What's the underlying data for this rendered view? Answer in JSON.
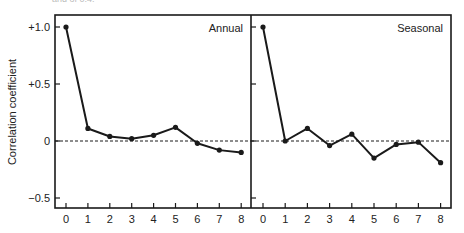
{
  "caption_fragment": "and of 0.4.",
  "chart_data": [
    {
      "type": "line",
      "title": "Annual",
      "xlabel": "",
      "ylabel": "Correlation coefficient",
      "x": [
        0,
        1,
        2,
        3,
        4,
        5,
        6,
        7,
        8
      ],
      "values": [
        1.0,
        0.11,
        0.04,
        0.02,
        0.05,
        0.12,
        -0.02,
        -0.08,
        -0.1
      ],
      "ylim": [
        -0.6,
        1.1
      ],
      "yticks": [
        1.0,
        0.5,
        0,
        -0.5
      ],
      "ytick_labels": [
        "+1.0",
        "+0.5",
        "0",
        "−0.5"
      ],
      "xticks": [
        0,
        1,
        2,
        3,
        4,
        5,
        6,
        7,
        8
      ],
      "reference_line": {
        "y": 0,
        "style": "dashed"
      },
      "grid": false,
      "legend": null
    },
    {
      "type": "line",
      "title": "Seasonal",
      "xlabel": "",
      "ylabel": "Correlation coefficient",
      "x": [
        0,
        1,
        2,
        3,
        4,
        5,
        6,
        7,
        8
      ],
      "values": [
        1.0,
        0.0,
        0.11,
        -0.04,
        0.06,
        -0.15,
        -0.03,
        -0.01,
        -0.19
      ],
      "ylim": [
        -0.6,
        1.1
      ],
      "yticks": [
        1.0,
        0.5,
        0,
        -0.5
      ],
      "xticks": [
        0,
        1,
        2,
        3,
        4,
        5,
        6,
        7,
        8
      ],
      "reference_line": {
        "y": 0,
        "style": "dashed"
      },
      "grid": false,
      "legend": null
    }
  ],
  "colors": {
    "line": "#1a1a1a",
    "axis": "#1a1a1a",
    "background": "#ffffff"
  }
}
